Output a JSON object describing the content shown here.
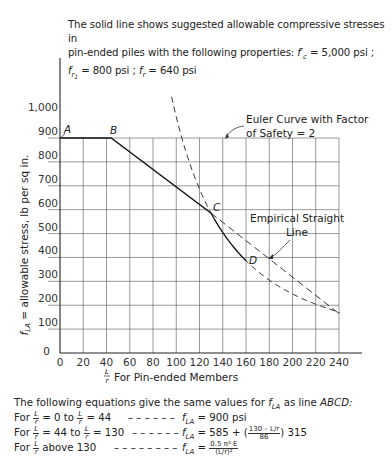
{
  "caption": {
    "line1": "The solid line shows suggested allowable compressive stresses in",
    "line2": "pin-ended piles with the following properties:",
    "fc_label": "f'c",
    "fc_value": "= 5,000 psi ;",
    "fr1_label": "fr1",
    "fr1_value": "= 800 psi ;",
    "fr_label": "fr",
    "fr_value": "= 640 psi"
  },
  "chart_data": {
    "type": "line",
    "xlabel": "L/r For Pin-ended Members",
    "ylabel": "fLA = allowable stress, lb per sq in.",
    "xlim": [
      0,
      240
    ],
    "ylim": [
      0,
      1000
    ],
    "x_ticks": [
      0,
      20,
      40,
      60,
      80,
      100,
      120,
      140,
      160,
      180,
      200,
      220,
      240
    ],
    "y_ticks": [
      0,
      100,
      200,
      300,
      400,
      500,
      600,
      700,
      800,
      900,
      1000
    ],
    "y_tick_labels": [
      "0",
      "100",
      "200",
      "300",
      "400",
      "500",
      "600",
      "700",
      "800",
      "900",
      "1,000"
    ],
    "grid": true,
    "series": [
      {
        "name": "Suggested allowable stress (solid ABCD)",
        "style": "solid",
        "x": [
          0,
          44,
          60,
          80,
          100,
          120,
          130,
          140,
          150,
          160
        ],
        "y": [
          900,
          900,
          841,
          768,
          695,
          622,
          585,
          504,
          439,
          386
        ]
      },
      {
        "name": "Euler Curve with Factor of Safety = 2",
        "style": "dashed",
        "x": [
          82,
          90,
          100,
          110,
          120,
          130,
          140,
          150,
          160,
          180,
          200,
          220,
          240
        ],
        "y": [
          1000,
          1221,
          989,
          817,
          687,
          585,
          504,
          439,
          386,
          305,
          247,
          204,
          172
        ]
      },
      {
        "name": "Empirical Straight Line",
        "style": "dashed",
        "x": [
          130,
          240
        ],
        "y": [
          585,
          165
        ]
      }
    ],
    "points": [
      {
        "label": "A",
        "x": 0,
        "y": 900
      },
      {
        "label": "B",
        "x": 44,
        "y": 900
      },
      {
        "label": "C",
        "x": 130,
        "y": 585
      },
      {
        "label": "D",
        "x": 160,
        "y": 386
      }
    ],
    "annotations": [
      {
        "text": "Euler Curve with Factor of Safety = 2",
        "points_to": "Euler curve near x=92"
      },
      {
        "text": "Empirical Straight Line",
        "points_to": "straight dashed line near x=175"
      }
    ]
  },
  "labels": {
    "euler_line1": "Euler Curve with Factor",
    "euler_line2": "of Safety = 2",
    "emp_line1": "Empirical Straight",
    "emp_line2": "Line",
    "pt_a": "A",
    "pt_b": "B",
    "pt_c": "C",
    "pt_d": "D",
    "ylabel": "fLA = allowable stress, lb per sq in.",
    "xlabel": "For Pin-ended Members"
  },
  "equations": {
    "intro": "The following equations give the same values for",
    "intro_sym": "fLA",
    "intro_tail": "as line",
    "intro_line": "ABCD:",
    "rows": [
      {
        "prefix": "For",
        "range_a": "= 0",
        "to": "to",
        "range_b": "= 44",
        "dashes": "– – – – – –",
        "lhs": "fLA",
        "rhs": "= 900 psi"
      },
      {
        "prefix": "For",
        "range_a": "= 44",
        "to": "to",
        "range_b": "= 130",
        "dashes": "– – – – – –",
        "lhs": "fLA",
        "rhs": "= 585 + (",
        "frac_num": "130 – L/r",
        "frac_den": "86",
        "rhs_tail": ") 315"
      },
      {
        "prefix": "For",
        "range_a": "above 130",
        "dashes": "– – – – – – – –",
        "lhs": "fLA",
        "rhs": "=",
        "frac_num": "0.5 π² E",
        "frac_den": "(L/r)²"
      }
    ]
  }
}
